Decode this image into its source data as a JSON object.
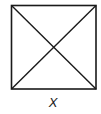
{
  "figure": {
    "shape": "square-with-diagonals",
    "square": {
      "x": 11,
      "y": 5,
      "size": 85
    },
    "stroke_color": "#1a1a1a",
    "label": "X"
  }
}
